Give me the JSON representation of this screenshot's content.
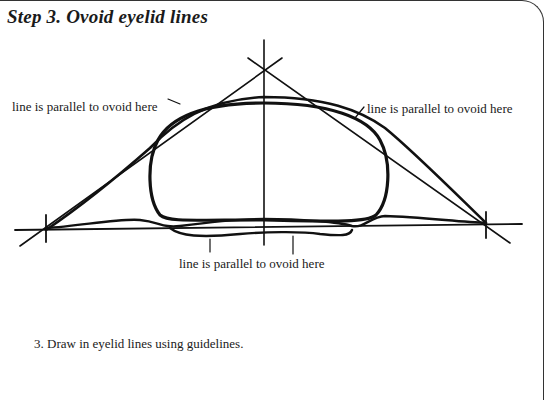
{
  "title": "Step 3. Ovoid eyelid lines",
  "labels": {
    "left": "line is parallel to ovoid here",
    "right": "line is parallel to ovoid here",
    "bottom": "line is parallel to ovoid here"
  },
  "caption": "3. Draw in eyelid lines using guidelines.",
  "colors": {
    "ink": "#111111",
    "background": "#ffffff"
  }
}
